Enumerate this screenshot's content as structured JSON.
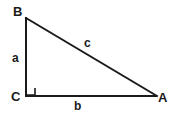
{
  "figure": {
    "name": "right-triangle-labeled",
    "background_color": "#ffffff",
    "stroke_color": "#1a1a1a",
    "stroke_width": 2,
    "canvas": {
      "width": 178,
      "height": 117
    },
    "vertices": [
      {
        "id": "B",
        "label": "B",
        "x": 26,
        "y": 18,
        "label_x": 13,
        "label_y": 5
      },
      {
        "id": "C",
        "label": "C",
        "x": 26,
        "y": 96,
        "label_x": 11,
        "label_y": 90
      },
      {
        "id": "A",
        "label": "A",
        "x": 156,
        "y": 96,
        "label_x": 158,
        "label_y": 91
      }
    ],
    "sides": [
      {
        "id": "a",
        "label": "a",
        "from": "B",
        "to": "C",
        "role": "vertical-leg",
        "label_x": 12,
        "label_y": 52
      },
      {
        "id": "b",
        "label": "b",
        "from": "C",
        "to": "A",
        "role": "horizontal-leg",
        "label_x": 74,
        "label_y": 100
      },
      {
        "id": "c",
        "label": "c",
        "from": "B",
        "to": "A",
        "role": "hypotenuse",
        "label_x": 84,
        "label_y": 37
      }
    ],
    "right_angle": {
      "at_vertex": "C",
      "marker": "square",
      "x": 27,
      "y": 88,
      "size": 8
    }
  }
}
